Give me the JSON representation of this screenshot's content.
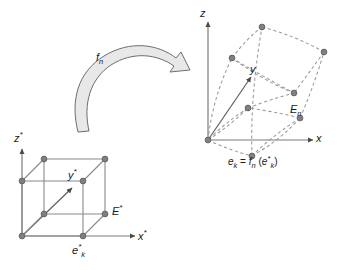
{
  "figure": {
    "background_color": "#ffffff",
    "line_color": "#6e6e6e",
    "node_color": "#808080",
    "node_stroke": "#5a5a5a",
    "axis_color": "#7a7a7a",
    "text_color": "#1a1a1a",
    "arrow_fill": "#e8e8e8",
    "arrow_stroke": "#6e6e6e"
  },
  "mapping_arrow": {
    "label": "f",
    "label_sub": "n"
  },
  "reference_element": {
    "name": "reference-element",
    "axis_x": {
      "label": "x",
      "sup": "*"
    },
    "axis_y": {
      "label": "y",
      "sup": "*"
    },
    "axis_z": {
      "label": "z",
      "sup": "*"
    },
    "element_label": {
      "label": "E",
      "sup": "*"
    },
    "node_label": {
      "label": "e",
      "sup": "*",
      "sub": "k"
    },
    "node_count": 8,
    "edge_style": "solid"
  },
  "physical_element": {
    "name": "physical-element",
    "axis_x": {
      "label": "x"
    },
    "axis_y": {
      "label": "y"
    },
    "axis_z": {
      "label": "z"
    },
    "element_label": {
      "label": "E",
      "sub": "n"
    },
    "node_count": 8,
    "edge_style": "dashed"
  },
  "equation": {
    "lhs": "e",
    "lhs_sub": "k",
    "operator": "=",
    "fn": "f",
    "fn_sub": "n",
    "open_paren": "(",
    "arg": "e",
    "arg_sup": "*",
    "arg_sub": "k",
    "close_paren": ")"
  }
}
